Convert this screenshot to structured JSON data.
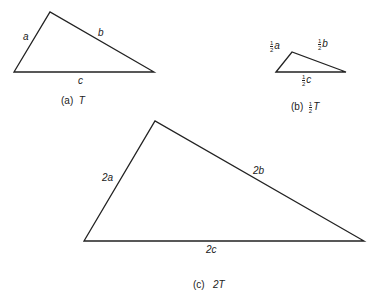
{
  "figures": [
    {
      "id": "a",
      "caption_tag": "(a)",
      "caption_name": "T",
      "vertices": [
        [
          14,
          72
        ],
        [
          50,
          12
        ],
        [
          154,
          72
        ]
      ],
      "labels": {
        "left": "a",
        "right": "b",
        "bottom": "c"
      }
    },
    {
      "id": "b",
      "caption_tag": "(b)",
      "caption_frac_num": "1",
      "caption_frac_den": "2",
      "caption_name": "T",
      "vertices": [
        [
          276,
          72
        ],
        [
          292,
          52
        ],
        [
          346,
          72
        ]
      ],
      "labels": {
        "left_num": "1",
        "left_den": "2",
        "left_var": "a",
        "right_num": "1",
        "right_den": "2",
        "right_var": "b",
        "bottom_num": "1",
        "bottom_den": "2",
        "bottom_var": "c"
      }
    },
    {
      "id": "c",
      "caption_tag": "(c)",
      "caption_name": "2T",
      "vertices": [
        [
          84,
          241
        ],
        [
          155,
          121
        ],
        [
          364,
          241
        ]
      ],
      "labels": {
        "left": "2a",
        "right": "2b",
        "bottom": "2c"
      }
    }
  ],
  "style": {
    "stroke": "#222222",
    "background": "#ffffff"
  }
}
